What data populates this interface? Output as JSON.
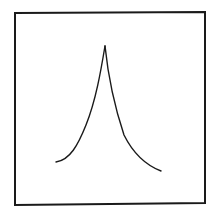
{
  "figure": {
    "stroke_color": "#1a1a1a",
    "background_color": "#ffffff",
    "frame": {
      "x1": 15,
      "y1": 13,
      "x2": 205,
      "y2": 12,
      "x3": 205,
      "y3": 203,
      "x4": 15,
      "y4": 205
    },
    "curve": {
      "peak": [
        105,
        46
      ],
      "left_end": [
        56,
        162
      ],
      "right_end": [
        161,
        171
      ]
    }
  }
}
